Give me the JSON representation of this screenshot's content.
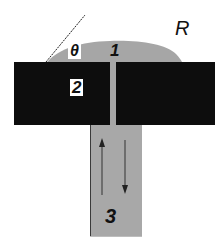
{
  "diagram": {
    "labels": {
      "theta": "θ",
      "droplet": "1",
      "plate": "2",
      "reservoir": "3",
      "radius": "R"
    },
    "colors": {
      "plate": "#0d0d0d",
      "droplet": "#a6a6a6",
      "channel": "#a6a6a6",
      "reservoir": "#a8a8a8",
      "reservoir_border": "#3a3a3a",
      "background": "#ffffff"
    },
    "arrows": [
      {
        "direction": "up"
      },
      {
        "direction": "down"
      }
    ]
  }
}
